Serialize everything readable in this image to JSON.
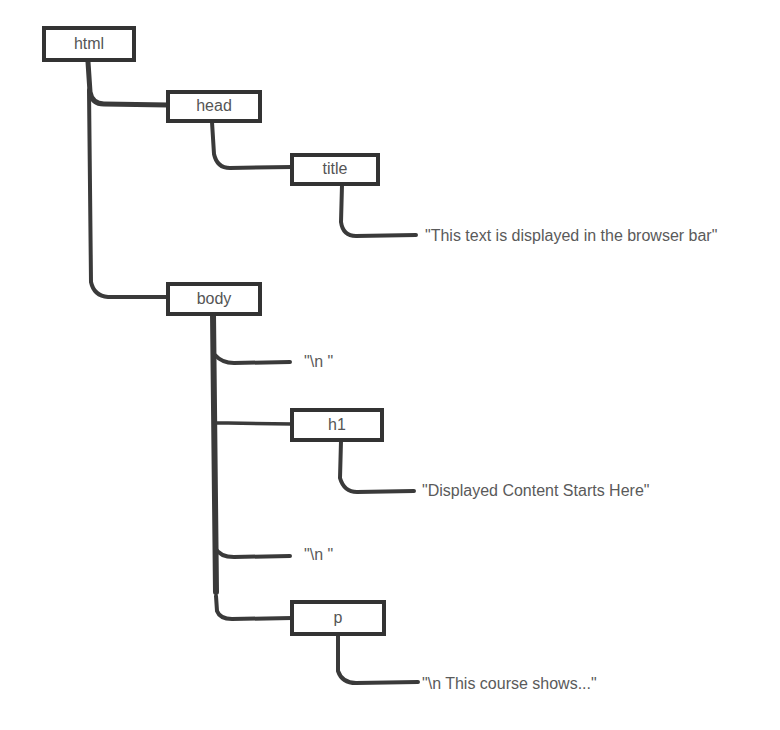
{
  "diagram": {
    "type": "dom-tree",
    "colors": {
      "stroke": "#333333",
      "text": "#555555",
      "background": "#ffffff"
    },
    "nodes": {
      "html": {
        "label": "html"
      },
      "head": {
        "label": "head"
      },
      "title": {
        "label": "title"
      },
      "title_text": {
        "label": "\"This text is displayed in the browser bar\""
      },
      "body": {
        "label": "body"
      },
      "ws1": {
        "label": "\"\\n \""
      },
      "h1": {
        "label": "h1"
      },
      "h1_text": {
        "label": "\"Displayed Content Starts Here\""
      },
      "ws2": {
        "label": "\"\\n \""
      },
      "p": {
        "label": "p"
      },
      "p_text": {
        "label": "\"\\n This course shows...\""
      }
    },
    "edges": [
      [
        "html",
        "head"
      ],
      [
        "head",
        "title"
      ],
      [
        "title",
        "title_text"
      ],
      [
        "html",
        "body"
      ],
      [
        "body",
        "ws1"
      ],
      [
        "body",
        "h1"
      ],
      [
        "h1",
        "h1_text"
      ],
      [
        "body",
        "ws2"
      ],
      [
        "body",
        "p"
      ],
      [
        "p",
        "p_text"
      ]
    ]
  }
}
